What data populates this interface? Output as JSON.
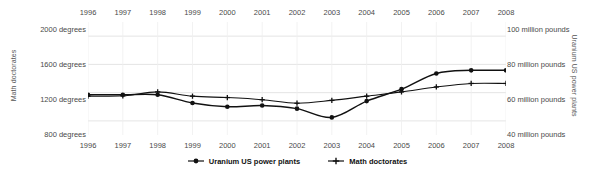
{
  "chart_data": {
    "type": "line",
    "title": "",
    "x": [
      1996,
      1997,
      1998,
      1999,
      2000,
      2001,
      2002,
      2003,
      2004,
      2005,
      2006,
      2007,
      2008
    ],
    "xlabel": "",
    "grid": true,
    "legend_position": "bottom",
    "series": [
      {
        "name": "Uranium US power plants",
        "axis": "right",
        "marker": "circle",
        "color": "#111111",
        "unit": "million pounds",
        "values": [
          62.0,
          62.0,
          62.0,
          55.5,
          52.5,
          53.5,
          51.0,
          44.0,
          57.0,
          66.5,
          79.0,
          81.5,
          81.5
        ]
      },
      {
        "name": "Math doctorates",
        "axis": "left",
        "marker": "plus",
        "color": "#111111",
        "unit": "degrees",
        "values": [
          1150,
          1155,
          1210,
          1150,
          1130,
          1100,
          1050,
          1090,
          1150,
          1210,
          1280,
          1330,
          1330
        ]
      }
    ],
    "y_left": {
      "label": "Math doctorates",
      "ticks": [
        800,
        1200,
        1600,
        2000
      ],
      "tick_labels": [
        "800 degrees",
        "1200 degrees",
        "1600 degrees",
        "2000 degrees"
      ],
      "ylim": [
        600,
        2200
      ]
    },
    "y_right": {
      "label": "Uranium US power plants",
      "ticks": [
        40,
        60,
        80,
        100
      ],
      "tick_labels": [
        "40 million pounds",
        "60 million pounds",
        "80 million pounds",
        "100 million pounds"
      ],
      "ylim": [
        30,
        120
      ]
    },
    "x_tick_labels_top": [
      "1996",
      "1997",
      "1998",
      "1999",
      "2000",
      "2001",
      "2002",
      "2003",
      "2004",
      "2005",
      "2006",
      "2007",
      "2008"
    ],
    "x_tick_labels_bottom": [
      "1996",
      "1997",
      "1998",
      "1999",
      "2000",
      "2001",
      "2002",
      "2003",
      "2004",
      "2005",
      "2006",
      "2007",
      "2008"
    ],
    "legend": [
      "Uranium US power plants",
      "Math doctorates"
    ]
  }
}
